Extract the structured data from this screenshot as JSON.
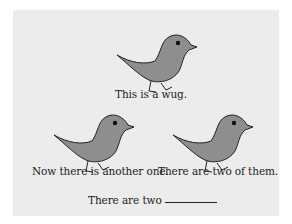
{
  "figure": {
    "panel_color": "#ececec",
    "bird_fill": "#8e8e8e",
    "bird_stroke": "#222222",
    "wugs": [
      {
        "id": "wug-top",
        "caption": "This is a wug."
      },
      {
        "id": "wug-left",
        "caption": "Now there is another one."
      },
      {
        "id": "wug-right",
        "caption": "There are two of them."
      }
    ],
    "prompt": {
      "text": "There are two",
      "blank": "________"
    }
  }
}
